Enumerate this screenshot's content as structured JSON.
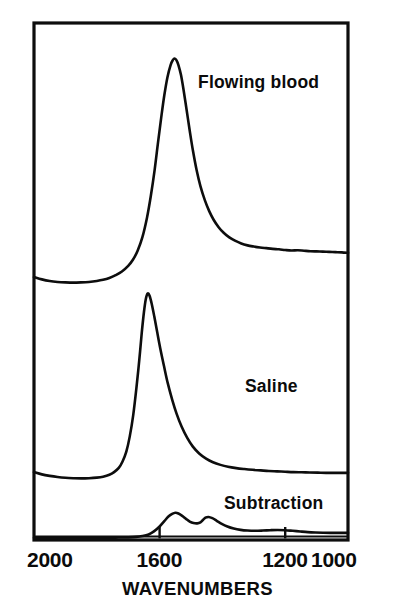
{
  "figure": {
    "kind": "spectroscopy-figure",
    "background_color": "#ffffff",
    "ink_color": "#0d0d0d"
  },
  "axis": {
    "title": "WAVENUMBERS",
    "tick_labels": [
      "2000",
      "1600",
      "1200",
      "1000"
    ],
    "tick_values": [
      2000,
      1600,
      1200,
      1000
    ],
    "direction": "descending-left-to-right"
  },
  "labels": {
    "flowing_blood": "Flowing blood",
    "saline": "Saline",
    "subtraction": "Subtraction"
  },
  "chart_data": {
    "type": "line",
    "title": "",
    "subtitle": "",
    "xlabel": "WAVENUMBERS",
    "ylabel": "",
    "xlim": [
      2000,
      1000
    ],
    "ylim": [
      0,
      1
    ],
    "grid": false,
    "legend": "inline-annotations",
    "x_tick_labels": [
      "2000",
      "1600",
      "1200",
      "1000"
    ],
    "x_ticks": [
      2000,
      1600,
      1200,
      1000
    ],
    "series": [
      {
        "name": "Flowing blood",
        "label_position": {
          "x": 1390,
          "y": 0.82
        },
        "peak_wavenumber": 1550,
        "baseline_level": 0.03,
        "x": [
          2000,
          1975,
          1950,
          1925,
          1900,
          1875,
          1850,
          1825,
          1800,
          1780,
          1760,
          1740,
          1720,
          1700,
          1685,
          1670,
          1655,
          1640,
          1628,
          1616,
          1605,
          1595,
          1585,
          1575,
          1565,
          1558,
          1552,
          1546,
          1540,
          1532,
          1524,
          1514,
          1504,
          1494,
          1482,
          1470,
          1456,
          1442,
          1428,
          1412,
          1396,
          1378,
          1360,
          1340,
          1320,
          1300,
          1280,
          1260,
          1240,
          1220,
          1200,
          1180,
          1160,
          1140,
          1120,
          1100,
          1080,
          1060,
          1040,
          1020,
          1000
        ],
        "y": [
          0.062,
          0.052,
          0.045,
          0.041,
          0.039,
          0.038,
          0.039,
          0.041,
          0.045,
          0.05,
          0.058,
          0.07,
          0.086,
          0.11,
          0.136,
          0.175,
          0.232,
          0.318,
          0.41,
          0.52,
          0.64,
          0.745,
          0.842,
          0.92,
          0.972,
          0.993,
          1.0,
          0.992,
          0.972,
          0.93,
          0.868,
          0.78,
          0.69,
          0.606,
          0.52,
          0.452,
          0.392,
          0.345,
          0.308,
          0.276,
          0.252,
          0.232,
          0.218,
          0.206,
          0.198,
          0.193,
          0.189,
          0.186,
          0.183,
          0.181,
          0.178,
          0.176,
          0.177,
          0.175,
          0.173,
          0.172,
          0.171,
          0.17,
          0.169,
          0.168,
          0.166
        ]
      },
      {
        "name": "Saline",
        "label_position": {
          "x": 1265,
          "y": 0.4
        },
        "peak_wavenumber": 1640,
        "baseline_level": 0.02,
        "x": [
          2000,
          1975,
          1950,
          1925,
          1900,
          1875,
          1850,
          1825,
          1800,
          1780,
          1760,
          1745,
          1730,
          1718,
          1706,
          1695,
          1684,
          1674,
          1665,
          1657,
          1650,
          1644,
          1638,
          1632,
          1625,
          1617,
          1608,
          1598,
          1586,
          1574,
          1560,
          1546,
          1530,
          1512,
          1494,
          1474,
          1452,
          1430,
          1406,
          1382,
          1356,
          1330,
          1304,
          1278,
          1252,
          1226,
          1200,
          1174,
          1148,
          1122,
          1096,
          1070,
          1044,
          1020,
          1000
        ],
        "y": [
          0.06,
          0.048,
          0.04,
          0.034,
          0.03,
          0.028,
          0.027,
          0.028,
          0.031,
          0.036,
          0.046,
          0.06,
          0.082,
          0.116,
          0.168,
          0.248,
          0.36,
          0.5,
          0.645,
          0.79,
          0.9,
          0.97,
          1.0,
          0.988,
          0.945,
          0.88,
          0.8,
          0.712,
          0.618,
          0.528,
          0.442,
          0.368,
          0.3,
          0.24,
          0.194,
          0.158,
          0.131,
          0.112,
          0.098,
          0.088,
          0.081,
          0.076,
          0.072,
          0.069,
          0.066,
          0.064,
          0.062,
          0.06,
          0.059,
          0.058,
          0.057,
          0.056,
          0.056,
          0.056,
          0.056
        ]
      },
      {
        "name": "Subtraction",
        "label_position": {
          "x": 1290,
          "y": 0.7
        },
        "peak_wavenumbers": [
          1550,
          1460
        ],
        "baseline_level": 0.05,
        "x": [
          2000,
          1960,
          1920,
          1880,
          1840,
          1800,
          1760,
          1730,
          1700,
          1675,
          1655,
          1635,
          1618,
          1600,
          1585,
          1572,
          1560,
          1550,
          1540,
          1528,
          1516,
          1504,
          1492,
          1480,
          1470,
          1462,
          1454,
          1444,
          1432,
          1418,
          1402,
          1384,
          1364,
          1342,
          1320,
          1296,
          1272,
          1248,
          1224,
          1200,
          1176,
          1152,
          1128,
          1104,
          1080,
          1056,
          1032,
          1012,
          1000
        ],
        "y": [
          0.03,
          0.03,
          0.031,
          0.031,
          0.032,
          0.033,
          0.035,
          0.038,
          0.044,
          0.056,
          0.078,
          0.12,
          0.2,
          0.33,
          0.47,
          0.59,
          0.66,
          0.69,
          0.672,
          0.61,
          0.53,
          0.46,
          0.42,
          0.412,
          0.44,
          0.5,
          0.56,
          0.58,
          0.548,
          0.48,
          0.4,
          0.33,
          0.276,
          0.24,
          0.222,
          0.216,
          0.222,
          0.232,
          0.238,
          0.232,
          0.216,
          0.198,
          0.182,
          0.172,
          0.166,
          0.162,
          0.16,
          0.16,
          0.16
        ]
      }
    ]
  }
}
